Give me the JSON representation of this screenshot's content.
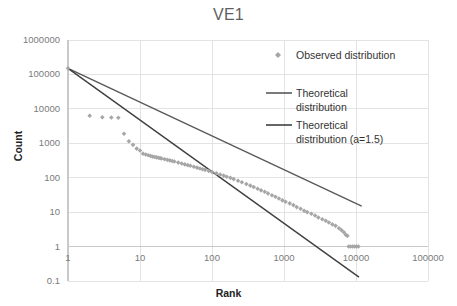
{
  "chart_data": {
    "type": "scatter",
    "title": "VE1",
    "xlabel": "Rank",
    "ylabel": "Count",
    "xscale": "log",
    "yscale": "log",
    "xlim": [
      1,
      100000
    ],
    "ylim": [
      0.1,
      1000000
    ],
    "xticks": [
      "1",
      "10",
      "100",
      "1000",
      "10000",
      "100000"
    ],
    "yticks": [
      "1000000",
      "100000",
      "10000",
      "1000",
      "100",
      "10",
      "1",
      "0.1"
    ],
    "grid": true,
    "legend_position": "right-inside",
    "series": [
      {
        "name": "Observed distribution",
        "type": "scatter",
        "marker": "diamond",
        "color": "#a6a6a6",
        "points": [
          [
            1,
            150000
          ],
          [
            2,
            6300
          ],
          [
            3,
            5700
          ],
          [
            4,
            5600
          ],
          [
            5,
            5500
          ],
          [
            6,
            1900
          ],
          [
            7,
            1150
          ],
          [
            8,
            900
          ],
          [
            9,
            700
          ],
          [
            10,
            620
          ],
          [
            11,
            500
          ],
          [
            12,
            470
          ],
          [
            13,
            450
          ],
          [
            14,
            430
          ],
          [
            15,
            410
          ],
          [
            16,
            400
          ],
          [
            17,
            390
          ],
          [
            18,
            380
          ],
          [
            19,
            370
          ],
          [
            20,
            360
          ],
          [
            22,
            345
          ],
          [
            24,
            330
          ],
          [
            26,
            318
          ],
          [
            28,
            305
          ],
          [
            30,
            295
          ],
          [
            34,
            275
          ],
          [
            38,
            258
          ],
          [
            42,
            244
          ],
          [
            46,
            232
          ],
          [
            50,
            222
          ],
          [
            56,
            208
          ],
          [
            62,
            196
          ],
          [
            68,
            186
          ],
          [
            74,
            177
          ],
          [
            80,
            169
          ],
          [
            90,
            157
          ],
          [
            100,
            147
          ],
          [
            115,
            134
          ],
          [
            130,
            124
          ],
          [
            145,
            115
          ],
          [
            160,
            107
          ],
          [
            180,
            99
          ],
          [
            200,
            91
          ],
          [
            230,
            82
          ],
          [
            260,
            74
          ],
          [
            300,
            66
          ],
          [
            340,
            59
          ],
          [
            380,
            54
          ],
          [
            430,
            48
          ],
          [
            480,
            43
          ],
          [
            540,
            39
          ],
          [
            600,
            35
          ],
          [
            680,
            31
          ],
          [
            760,
            28
          ],
          [
            850,
            25
          ],
          [
            950,
            22
          ],
          [
            1050,
            20
          ],
          [
            1200,
            18
          ],
          [
            1350,
            16
          ],
          [
            1500,
            14
          ],
          [
            1700,
            12.5
          ],
          [
            1900,
            11
          ],
          [
            2100,
            10
          ],
          [
            2400,
            9
          ],
          [
            2700,
            8
          ],
          [
            3000,
            7
          ],
          [
            3400,
            6.2
          ],
          [
            3800,
            5.6
          ],
          [
            4200,
            5
          ],
          [
            4700,
            4.4
          ],
          [
            5200,
            4
          ],
          [
            5800,
            3.4
          ],
          [
            6300,
            3
          ],
          [
            6800,
            2.6
          ],
          [
            7200,
            2.2
          ],
          [
            7600,
            2.05
          ],
          [
            7900,
            1.0
          ],
          [
            8400,
            1.0
          ],
          [
            9000,
            1.0
          ],
          [
            9600,
            1.0
          ],
          [
            10200,
            1.0
          ],
          [
            10800,
            1.0
          ]
        ]
      },
      {
        "name": "Theoretical distribution",
        "type": "line",
        "color": "#595959",
        "endpoints": [
          [
            1,
            150000
          ],
          [
            12000,
            15
          ]
        ]
      },
      {
        "name": "Theoretical distribution (a=1.5)",
        "type": "line",
        "color": "#404040",
        "endpoints": [
          [
            1,
            150000
          ],
          [
            11000,
            0.13
          ]
        ]
      }
    ]
  },
  "legend": {
    "items": [
      {
        "label": "Observed distribution",
        "marker": "diamond",
        "color": "#a6a6a6"
      },
      {
        "label": "Theoretical",
        "label2": "distribution",
        "marker": "line",
        "color": "#595959"
      },
      {
        "label": "Theoretical",
        "label2": "distribution (a=1.5)",
        "marker": "line",
        "color": "#404040"
      }
    ]
  },
  "colors": {
    "observed": "#a6a6a6",
    "theory1": "#595959",
    "theory2": "#404040",
    "grid": "#e3e3e3",
    "axis": "#c9c9c9",
    "tick_text": "#7b7b7b",
    "title": "#5f5f5f"
  }
}
